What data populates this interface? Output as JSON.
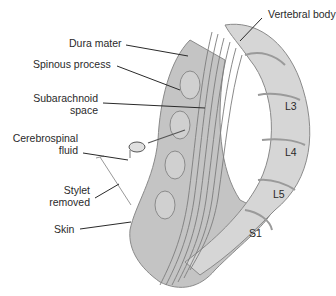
{
  "diagram": {
    "labels": {
      "vertebral_body": "Vertebral body",
      "dura_mater": "Dura mater",
      "spinous_process": "Spinous process",
      "subarachnoid_space_line1": "Subarachnoid",
      "subarachnoid_space_line2": "space",
      "csf_line1": "Cerebrospinal",
      "csf_line2": "fluid",
      "stylet_line1": "Stylet",
      "stylet_line2": "removed",
      "skin": "Skin",
      "l3": "L3",
      "l4": "L4",
      "l5": "L5",
      "s1": "S1"
    },
    "colors": {
      "tissue": "#bdbdbd",
      "tissue_dark": "#8f8f8f",
      "bone": "#d2d2d2",
      "line": "#2a2a2a",
      "background": "#ffffff"
    }
  }
}
